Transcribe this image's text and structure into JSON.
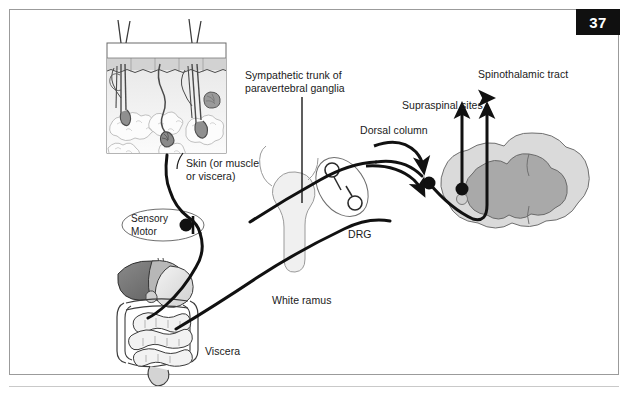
{
  "page": {
    "number": "37"
  },
  "figure": {
    "labels": {
      "sympathetic_trunk": "Sympathetic trunk of\nparavertebral ganglia",
      "skin": "Skin (or muscle\nor viscera)",
      "spinothalamic_tract": "Spinothalamic tract",
      "supraspinal_sites": "Supraspinal sites",
      "dorsal_column": "Dorsal column",
      "drg": "DRG",
      "white_ramus": "White ramus",
      "viscera": "Viscera",
      "sensory_motor": "Sensory\nMotor"
    },
    "structures": {
      "skin_inset": "skin-cross-section-inset",
      "viscera_organs": "abdominal-viscera-illustration",
      "spinal_cord": "spinal-cord-cross-section",
      "drg_ganglion": "dorsal-root-ganglion",
      "sympathetic_ganglion": "sympathetic-chain-ganglion"
    },
    "colors": {
      "line": "#111111",
      "frame": "#9b9b9b",
      "page_box": "#101010",
      "gray_matter": "#a8a8a8",
      "white_matter": "#d8d8d8",
      "organ_dark": "#6e6e6e",
      "organ_light": "#e2e2e2"
    }
  }
}
